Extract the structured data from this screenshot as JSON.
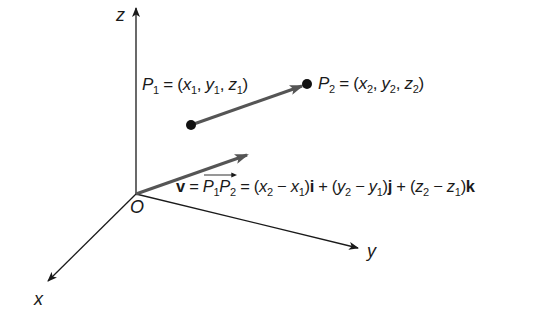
{
  "diagram": {
    "type": "3d-vector-diagram",
    "colors": {
      "axis": "#1a1a1a",
      "vector": "#555555",
      "point": "#111111",
      "text": "#1a1a1a"
    },
    "axes": {
      "z_label": "z",
      "y_label": "y",
      "x_label": "x",
      "origin_label": "O"
    },
    "points": {
      "p1": {
        "name": "P",
        "sub": "1",
        "eq": " = (",
        "x": "x",
        "x_sub": "1",
        "y": "y",
        "y_sub": "1",
        "z": "z",
        "z_sub": "1",
        "close": ")"
      },
      "p2": {
        "name": "P",
        "sub": "2",
        "eq": " = (",
        "x": "x",
        "x_sub": "2",
        "y": "y",
        "y_sub": "2",
        "z": "z",
        "z_sub": "2",
        "close": ")"
      }
    },
    "vector_equation": {
      "v": "v",
      "eq1": " = ",
      "p1": "P",
      "p1_sub": "1",
      "p2": "P",
      "p2_sub": "2",
      "eq2": " = (",
      "x2": "x",
      "x2_sub": "2",
      "minus1": " − ",
      "x1": "x",
      "x1_sub": "1",
      "close1": ")",
      "i": "i",
      "plus1": " + (",
      "y2": "y",
      "y2_sub": "2",
      "minus2": " − ",
      "y1": "y",
      "y1_sub": "1",
      "close2": ")",
      "j": "j",
      "plus2": " + (",
      "z2": "z",
      "z2_sub": "2",
      "minus3": " − ",
      "z1": "z",
      "z1_sub": "1",
      "close3": ")",
      "k": "k"
    },
    "comma": ", "
  }
}
